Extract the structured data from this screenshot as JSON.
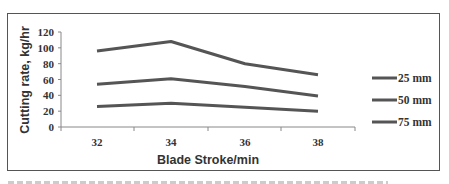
{
  "chart_data": {
    "type": "line",
    "title": "",
    "xlabel": "Blade Stroke/min",
    "ylabel": "Cutting rate, kg/hr",
    "categories": [
      "32",
      "34",
      "36",
      "38"
    ],
    "x": [
      32,
      34,
      36,
      38
    ],
    "ylim": [
      0,
      120
    ],
    "yticks": [
      0,
      20,
      40,
      60,
      80,
      100,
      120
    ],
    "grid": false,
    "legend_position": "right",
    "series": [
      {
        "name": "25 mm",
        "values": [
          96,
          108,
          80,
          66
        ]
      },
      {
        "name": "50 mm",
        "values": [
          54,
          61,
          51,
          39
        ]
      },
      {
        "name": "75 mm",
        "values": [
          26,
          30,
          25,
          20
        ]
      }
    ],
    "line_color": "#555555"
  },
  "axes": {
    "x_title": "Blade Stroke/min",
    "y_title": "Cutting rate, kg/hr",
    "x_ticks": [
      "32",
      "34",
      "36",
      "38"
    ],
    "y_ticks": [
      "0",
      "20",
      "40",
      "60",
      "80",
      "100",
      "120"
    ]
  },
  "legend": {
    "items": [
      {
        "label": "25 mm"
      },
      {
        "label": "50 mm"
      },
      {
        "label": "75 mm"
      }
    ]
  }
}
